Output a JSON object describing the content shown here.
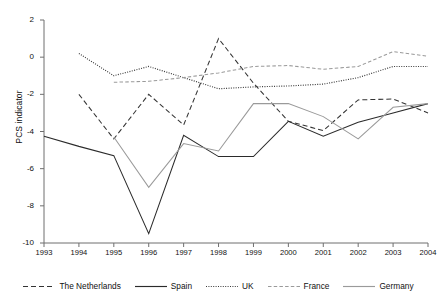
{
  "chart_data": {
    "type": "line",
    "title": "",
    "xlabel": "",
    "ylabel": "PCS indicator",
    "x": [
      1993,
      1994,
      1995,
      1996,
      1997,
      1998,
      1999,
      2000,
      2001,
      2002,
      2003,
      2004
    ],
    "xtick_labels": [
      "1993",
      "1994",
      "1995",
      "1996",
      "1997",
      "1998",
      "1999",
      "2000",
      "2001",
      "2002",
      "2003",
      "2004"
    ],
    "ytick_labels": [
      "2",
      "0",
      "-2",
      "-4",
      "-6",
      "-8",
      "-10"
    ],
    "yticks": [
      2,
      0,
      -2,
      -4,
      -6,
      -8,
      -10
    ],
    "ylim": [
      -10,
      2
    ],
    "xlim": [
      1993,
      2004
    ],
    "grid": false,
    "legend_position": "bottom",
    "series": [
      {
        "name": "The Netherlands",
        "style": "dashed",
        "color": "#333333",
        "x": [
          1994,
          1995,
          1996,
          1997,
          1998,
          1999,
          2000,
          2001,
          2002,
          2003,
          2004
        ],
        "values": [
          -2.0,
          -4.4,
          -2.0,
          -3.65,
          1.0,
          -1.4,
          -3.45,
          -3.95,
          -2.3,
          -2.25,
          -3.0
        ]
      },
      {
        "name": "Spain",
        "style": "solid",
        "color": "#2b2b2b",
        "x": [
          1993,
          1994,
          1995,
          1996,
          1997,
          1998,
          1999,
          2000,
          2001,
          2002,
          2003,
          2004
        ],
        "values": [
          -4.25,
          -4.8,
          -5.3,
          -9.5,
          -4.2,
          -5.35,
          -5.35,
          -3.45,
          -4.25,
          -3.5,
          -3.0,
          -2.5
        ]
      },
      {
        "name": "UK",
        "style": "dotted",
        "color": "#3a3a3a",
        "x": [
          1994,
          1995,
          1996,
          1997,
          1998,
          1999,
          2000,
          2001,
          2002,
          2003,
          2004
        ],
        "values": [
          0.2,
          -1.0,
          -0.5,
          -1.1,
          -1.7,
          -1.6,
          -1.55,
          -1.45,
          -1.1,
          -0.5,
          -0.5
        ]
      },
      {
        "name": "France",
        "style": "fine-dashed",
        "color": "#9a9a9a",
        "x": [
          1995,
          1996,
          1997,
          1998,
          1999,
          2000,
          2001,
          2002,
          2003,
          2004
        ],
        "values": [
          -1.35,
          -1.3,
          -1.1,
          -0.85,
          -0.5,
          -0.45,
          -0.65,
          -0.5,
          0.3,
          0.05
        ]
      },
      {
        "name": "Germany",
        "style": "solid",
        "color": "#9a9a9a",
        "x": [
          1995,
          1996,
          1997,
          1998,
          1999,
          2000,
          2001,
          2002,
          2003,
          2004
        ],
        "values": [
          -4.3,
          -7.0,
          -4.65,
          -5.05,
          -2.5,
          -2.5,
          -3.2,
          -4.4,
          -2.7,
          -2.5
        ]
      }
    ]
  },
  "legend": {
    "items": [
      {
        "label": "The Netherlands",
        "icon": "dashed-line-icon"
      },
      {
        "label": "Spain",
        "icon": "solid-line-icon"
      },
      {
        "label": "UK",
        "icon": "dotted-line-icon"
      },
      {
        "label": "France",
        "icon": "fine-dashed-line-icon"
      },
      {
        "label": "Germany",
        "icon": "solid-gray-line-icon"
      }
    ]
  }
}
